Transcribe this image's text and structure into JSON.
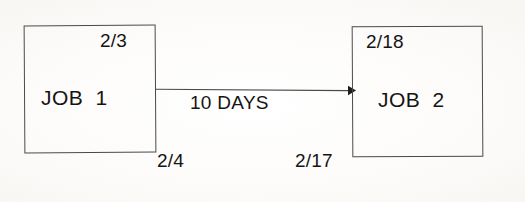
{
  "diagram": {
    "type": "precedence-network-diagram",
    "background_color": "#fbfaf8",
    "line_color": "#4a4a4a",
    "text_color": "#141414"
  },
  "nodes": [
    {
      "id": "job1",
      "name": "JOB  1",
      "early_date": "2/3",
      "late_date": "2/4"
    },
    {
      "id": "job2",
      "name": "JOB  2",
      "early_date": "2/18",
      "late_date": "2/17"
    }
  ],
  "arrow": {
    "label": "10 DAYS",
    "from": "job1",
    "to": "job2",
    "direction": "right"
  }
}
